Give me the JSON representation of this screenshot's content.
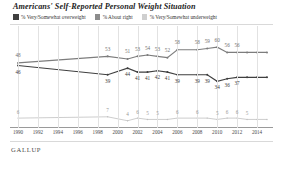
{
  "header": {
    "title": "Americans' Self-Reported Personal Weight Situation"
  },
  "legend": {
    "items": [
      {
        "label": "% Very/Somewhat overweight",
        "color": "#3f3f3f",
        "name": "legend-overweight"
      },
      {
        "label": "% About right",
        "color": "#7d7d7d",
        "name": "legend-about-right"
      },
      {
        "label": "% Very/Somewhat underweight",
        "color": "#c4c4c4",
        "name": "legend-underweight"
      }
    ]
  },
  "footer": {
    "brand": "GALLUP"
  },
  "chart_data": {
    "type": "line",
    "title": "Americans' Self-Reported Personal Weight Situation",
    "xlabel": "",
    "ylabel": "",
    "ylim": [
      0,
      70
    ],
    "grid": true,
    "legend_position": "top",
    "x": [
      1990,
      1999,
      2001,
      2002,
      2003,
      2004,
      2005,
      2006,
      2008,
      2009,
      2010,
      2011,
      2012,
      2013,
      2014,
      2015
    ],
    "xticks": [
      "1990",
      "1992",
      "1994",
      "1996",
      "1998",
      "2000",
      "2002",
      "2004",
      "2006",
      "2008",
      "2010",
      "2012",
      "2014"
    ],
    "series": [
      {
        "name": "% Very/Somewhat overweight",
        "color": "#7d7d7d",
        "values": [
          48,
          53,
          51,
          53,
          54,
          53,
          52,
          58,
          58,
          59,
          60,
          56,
          56,
          56,
          56,
          56
        ],
        "labels": [
          "48",
          "53",
          "51",
          "53",
          "54",
          "53",
          "52",
          "58",
          "58",
          "59",
          "60",
          "56",
          "56",
          "",
          "",
          ""
        ]
      },
      {
        "name": "% About right",
        "color": "#3f3f3f",
        "values": [
          46,
          39,
          44,
          41,
          41,
          42,
          41,
          39,
          39,
          39,
          34,
          36,
          37,
          37,
          37,
          37
        ],
        "labels": [
          "46",
          "39",
          "44",
          "41",
          "41",
          "42",
          "41",
          "39",
          "39",
          "39",
          "34",
          "36",
          "37",
          "",
          "",
          ""
        ]
      },
      {
        "name": "% Very/Somewhat underweight",
        "color": "#c0c0c0",
        "values": [
          6,
          7,
          4,
          6,
          5,
          5,
          5,
          6,
          6,
          6,
          5,
          6,
          6,
          5,
          5,
          5
        ],
        "labels": [
          "6",
          "7",
          "4",
          "6",
          "5",
          "5",
          "",
          "6",
          "6",
          "",
          "5",
          "6",
          "6",
          "5",
          "",
          ""
        ]
      }
    ]
  }
}
